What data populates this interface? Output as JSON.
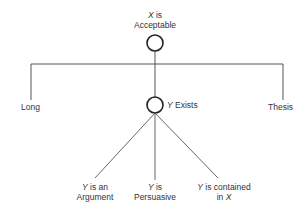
{
  "diagram": {
    "root": {
      "var": "X",
      "line1_rest": " is",
      "line2": "Acceptable"
    },
    "branches": {
      "left": {
        "label": "Long"
      },
      "middle": {
        "var": "Y",
        "rest": " Exists"
      },
      "right": {
        "label": "Thesis"
      }
    },
    "leaves": [
      {
        "var": "Y",
        "line1_rest": " is an",
        "line2": "Argument"
      },
      {
        "var": "Y",
        "line1_rest": " is",
        "line2": "Persuasive"
      },
      {
        "var": "Y",
        "line1_rest": " is contained",
        "line2_prefix": "in ",
        "line2_var": "X"
      }
    ],
    "colors": {
      "line": "#555555",
      "node_stroke": "#222222",
      "text": "#333333"
    }
  }
}
